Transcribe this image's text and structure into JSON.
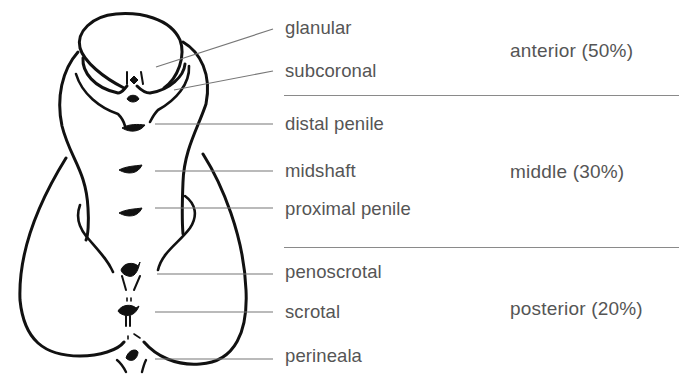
{
  "diagram": {
    "type": "anatomical-labeled-diagram",
    "line_color": "#111111",
    "leader_color": "#777777",
    "text_color": "#555555"
  },
  "labels": [
    {
      "id": "glanular",
      "text": "glanular"
    },
    {
      "id": "subcoronal",
      "text": "subcoronal"
    },
    {
      "id": "distal-penile",
      "text": "distal penile"
    },
    {
      "id": "midshaft",
      "text": "midshaft"
    },
    {
      "id": "proximal-penile",
      "text": "proximal penile"
    },
    {
      "id": "penoscrotal",
      "text": "penoscrotal"
    },
    {
      "id": "scrotal",
      "text": "scrotal"
    },
    {
      "id": "perineala",
      "text": "perineala"
    }
  ],
  "regions": [
    {
      "id": "anterior",
      "text": "anterior (50%)",
      "name": "anterior",
      "percent": "50%"
    },
    {
      "id": "middle",
      "text": "middle (30%)",
      "name": "middle",
      "percent": "30%"
    },
    {
      "id": "posterior",
      "text": "posterior (20%)",
      "name": "posterior",
      "percent": "20%"
    }
  ]
}
